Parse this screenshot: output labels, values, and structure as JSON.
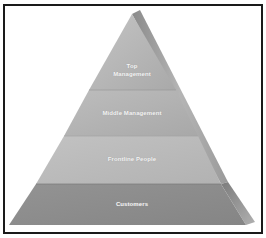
{
  "diagram": {
    "type": "pyramid",
    "levels": [
      {
        "label_line1": "Top",
        "label_line2": "Management",
        "color": "#b3b3b3"
      },
      {
        "label": "Middle Management",
        "color": "#b0b0b0"
      },
      {
        "label": "Frontline People",
        "color": "#b8b8b8"
      },
      {
        "label": "Customers",
        "color": "#8e8e8e"
      }
    ]
  }
}
